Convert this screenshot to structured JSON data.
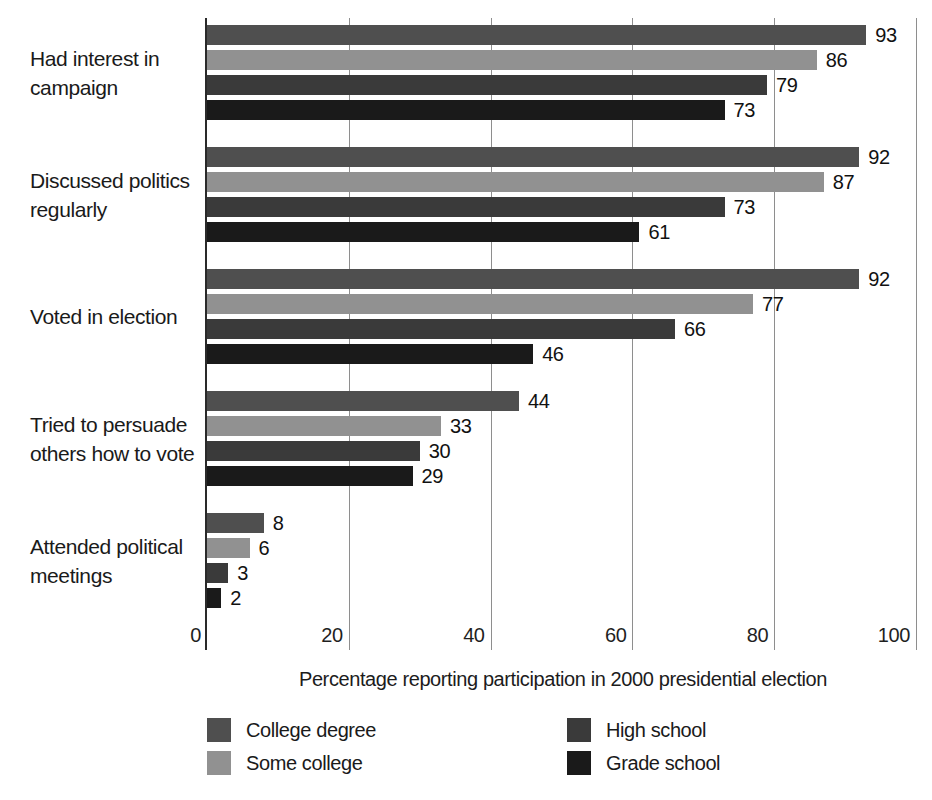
{
  "chart_data": {
    "type": "bar",
    "orientation": "horizontal",
    "title": "",
    "xlabel": "Percentage reporting participation in 2000 presidential election",
    "ylabel": "",
    "xlim": [
      0,
      100
    ],
    "xticks": [
      0,
      20,
      40,
      60,
      80,
      100
    ],
    "grid": "vertical gridlines at each x tick, extending below plot to tick labels",
    "value_labels": true,
    "legend_position": "bottom, two columns",
    "categories": [
      "Had interest in campaign",
      "Discussed politics regularly",
      "Voted in election",
      "Tried to persuade others how to vote",
      "Attended political meetings"
    ],
    "series": [
      {
        "name": "College degree",
        "color": "#4f4f4f",
        "values": [
          93,
          92,
          92,
          44,
          8
        ]
      },
      {
        "name": "Some college",
        "color": "#919191",
        "values": [
          86,
          87,
          77,
          33,
          6
        ]
      },
      {
        "name": "High school",
        "color": "#3a3a3a",
        "values": [
          79,
          73,
          66,
          30,
          3
        ]
      },
      {
        "name": "Grade school",
        "color": "#1a1a1a",
        "values": [
          73,
          61,
          46,
          29,
          2
        ]
      }
    ],
    "colors": {
      "background": "#ffffff",
      "gridline": "#8e8e8e",
      "axis_line": "#2a2a2a",
      "text": "#1a1a1a"
    }
  }
}
